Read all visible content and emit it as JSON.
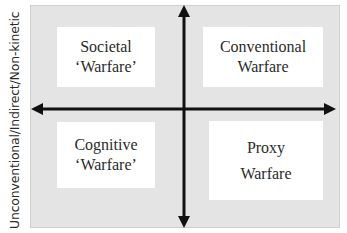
{
  "diagram": {
    "type": "quadrant",
    "y_axis_label": "Unconventional/Indirect/Non-kinetic",
    "quadrants": {
      "top_left": {
        "line1": "Societal",
        "line2": "‘Warfare’"
      },
      "top_right": {
        "line1": "Conventional",
        "line2": "Warfare"
      },
      "bottom_left": {
        "line1": "Cognitive",
        "line2": "‘Warfare’"
      },
      "bottom_right": {
        "line1": "Proxy",
        "line2": "Warfare"
      }
    },
    "colors": {
      "panel_background": "#e4e4e4",
      "box_background": "#ffffff",
      "axis": "#111111",
      "text": "#2b2b2b"
    },
    "icons": {
      "arrows": [
        "arrow-up-icon",
        "arrow-down-icon",
        "arrow-left-icon",
        "arrow-right-icon"
      ]
    }
  }
}
